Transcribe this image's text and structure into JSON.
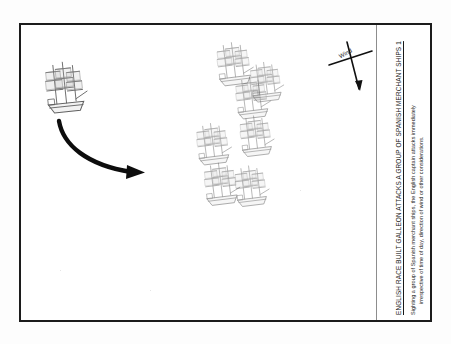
{
  "document": {
    "type": "naval-tactics-plate",
    "frame_color": "#1c1c1c",
    "background_color": "#ffffff"
  },
  "caption": {
    "title": "ENGLISH RACE BUILT GALLEON ATTACKS A GROUP OF SPANISH MERCHANT SHIPS 1",
    "body_line_1": "Sighting a group of Spanish merchant ships, the English captain attacks immediately",
    "body_line_2": "irrespective of time of day, direction of wind or other considerations."
  },
  "wind_rose": {
    "label": "Wind",
    "icon": "wind-arrow-icon",
    "direction_description": "arrow pointing down and to the right"
  },
  "drawing": {
    "attack_arrow": {
      "icon": "curved-attack-arrow-icon",
      "description": "thick curved arrow sweeping from the English galleon down and to the right toward the merchant group"
    },
    "english_galleon": {
      "label": "English race built galleon",
      "icon": "sailing-ship-icon",
      "count": 1
    },
    "spanish_merchant_ships": {
      "label": "Spanish merchant ships",
      "icon": "sailing-ship-icon",
      "count": 7,
      "positions": [
        {
          "x": 196,
          "y": 20,
          "scale": 1.0
        },
        {
          "x": 213,
          "y": 54,
          "scale": 0.96
        },
        {
          "x": 228,
          "y": 38,
          "scale": 0.92
        },
        {
          "x": 175,
          "y": 100,
          "scale": 0.96
        },
        {
          "x": 218,
          "y": 92,
          "scale": 0.94
        },
        {
          "x": 183,
          "y": 140,
          "scale": 0.98
        },
        {
          "x": 213,
          "y": 142,
          "scale": 0.94
        }
      ]
    }
  }
}
